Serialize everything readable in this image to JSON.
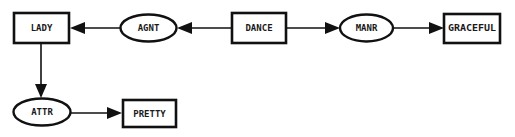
{
  "diagram": {
    "type": "conceptual-graph",
    "concepts": [
      {
        "id": "lady",
        "label": "LADY"
      },
      {
        "id": "dance",
        "label": "DANCE"
      },
      {
        "id": "graceful",
        "label": "GRACEFUL"
      },
      {
        "id": "pretty",
        "label": "PRETTY"
      }
    ],
    "relations": [
      {
        "id": "agnt",
        "label": "AGNT"
      },
      {
        "id": "manr",
        "label": "MANR"
      },
      {
        "id": "attr",
        "label": "ATTR"
      }
    ],
    "edges": [
      {
        "from": "dance",
        "to": "agnt"
      },
      {
        "from": "agnt",
        "to": "lady"
      },
      {
        "from": "dance",
        "to": "manr"
      },
      {
        "from": "manr",
        "to": "graceful"
      },
      {
        "from": "lady",
        "to": "attr"
      },
      {
        "from": "attr",
        "to": "pretty"
      }
    ]
  }
}
